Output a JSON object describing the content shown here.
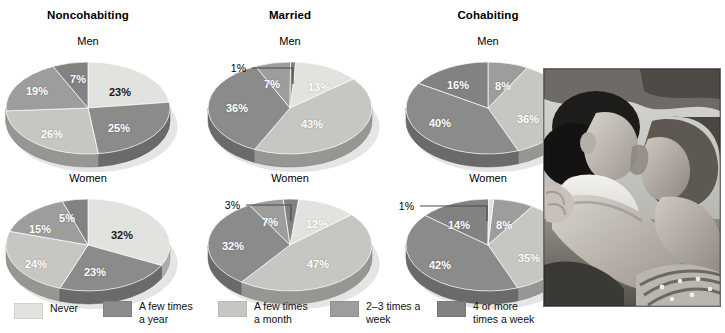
{
  "figure": {
    "columns": [
      "Noncohabiting",
      "Married",
      "Cohabiting"
    ],
    "row_labels": [
      "Men",
      "Women"
    ]
  },
  "legend": {
    "items": [
      {
        "label": "Never",
        "color": "#e2e2de"
      },
      {
        "label": "A few times\na year",
        "color": "#8b8b8b"
      },
      {
        "label": "A few times\na month",
        "color": "#c6c6c2"
      },
      {
        "label": "2–3 times  a\nweek",
        "color": "#9d9d9b"
      },
      {
        "label": "4 or more\ntimes a week",
        "color": "#828282"
      }
    ]
  },
  "photo": {
    "caption": "black-and-white photograph of a couple embracing"
  },
  "chart_data": [
    {
      "type": "pie",
      "title": "Noncohabiting — Men",
      "group": "Noncohabiting",
      "sex": "Men",
      "categories": [
        "Never",
        "A few times a year",
        "A few times a month",
        "2–3 times a week",
        "4 or more times a week"
      ],
      "labels": [
        "23%",
        "25%",
        "26%",
        "19%",
        "7%"
      ],
      "values": [
        23,
        25,
        26,
        19,
        7
      ],
      "colors": [
        "#e2e2de",
        "#8b8b8b",
        "#c6c6c2",
        "#9d9d9b",
        "#828282"
      ],
      "callout": null
    },
    {
      "type": "pie",
      "title": "Married — Men",
      "group": "Married",
      "sex": "Men",
      "categories": [
        "Never",
        "A few times a year",
        "A few times a month",
        "2–3 times a week",
        "4 or more times a week"
      ],
      "labels": [
        "13%",
        "43%",
        "36%",
        "7%",
        "1%"
      ],
      "values": [
        13,
        43,
        36,
        7,
        1
      ],
      "colors": [
        "#e2e2de",
        "#c6c6c2",
        "#8b8b8b",
        "#9d9d9b",
        "#828282"
      ],
      "callout": "1%"
    },
    {
      "type": "pie",
      "title": "Cohabiting — Men",
      "group": "Cohabiting",
      "sex": "Men",
      "categories": [
        "Never",
        "A few times a year",
        "A few times a month",
        "2–3 times a week",
        "4 or more times a week"
      ],
      "labels": [
        "8%",
        "36%",
        "40%",
        "16%"
      ],
      "values": [
        8,
        36,
        40,
        16
      ],
      "colors": [
        "#9d9d9b",
        "#c6c6c2",
        "#8b8b8b",
        "#828282"
      ],
      "callout": null
    },
    {
      "type": "pie",
      "title": "Noncohabiting — Women",
      "group": "Noncohabiting",
      "sex": "Women",
      "categories": [
        "Never",
        "A few times a year",
        "A few times a month",
        "2–3 times a week",
        "4 or more times a week"
      ],
      "labels": [
        "32%",
        "23%",
        "24%",
        "15%",
        "5%"
      ],
      "values": [
        32,
        23,
        24,
        15,
        5
      ],
      "colors": [
        "#e2e2de",
        "#8b8b8b",
        "#c6c6c2",
        "#9d9d9b",
        "#828282"
      ],
      "callout": null
    },
    {
      "type": "pie",
      "title": "Married — Women",
      "group": "Married",
      "sex": "Women",
      "categories": [
        "Never",
        "A few times a year",
        "A few times a month",
        "2–3 times a week",
        "4 or more times a week"
      ],
      "labels": [
        "12%",
        "47%",
        "32%",
        "7%",
        "3%"
      ],
      "values": [
        12,
        47,
        32,
        7,
        3
      ],
      "colors": [
        "#e2e2de",
        "#c6c6c2",
        "#8b8b8b",
        "#9d9d9b",
        "#828282"
      ],
      "callout": "3%"
    },
    {
      "type": "pie",
      "title": "Cohabiting — Women",
      "group": "Cohabiting",
      "sex": "Women",
      "categories": [
        "Never",
        "A few times a year",
        "A few times a month",
        "2–3 times a week",
        "4 or more times a week"
      ],
      "labels": [
        "8%",
        "35%",
        "42%",
        "14%",
        "1%"
      ],
      "values": [
        8,
        35,
        42,
        14,
        1
      ],
      "colors": [
        "#9d9d9b",
        "#c6c6c2",
        "#8b8b8b",
        "#828282",
        "#e2e2de"
      ],
      "callout": "1%"
    }
  ],
  "chart_layout": [
    {
      "cx": 100,
      "cy": 56,
      "rx": 82,
      "ry": 46,
      "depth": 13,
      "start": -90,
      "label_pos": [
        {
          "t": "23%",
          "x": 132,
          "y": 40,
          "tone": "dark"
        },
        {
          "t": "25%",
          "x": 131,
          "y": 76,
          "tone": "light"
        },
        {
          "t": "26%",
          "x": 64,
          "y": 82,
          "tone": "light"
        },
        {
          "t": "19%",
          "x": 49,
          "y": 39,
          "tone": "light"
        },
        {
          "t": "7%",
          "x": 90,
          "y": 27,
          "tone": "light"
        }
      ]
    },
    {
      "cx": 100,
      "cy": 56,
      "rx": 82,
      "ry": 46,
      "depth": 13,
      "start": -86,
      "label_pos": [
        {
          "t": "13%",
          "x": 129,
          "y": 35,
          "tone": "light"
        },
        {
          "t": "43%",
          "x": 122,
          "y": 72,
          "tone": "light"
        },
        {
          "t": "36%",
          "x": 47,
          "y": 56,
          "tone": "light"
        },
        {
          "t": "7%",
          "x": 82,
          "y": 32,
          "tone": "light"
        }
      ],
      "callout_pos": {
        "x": 56,
        "y": 16,
        "lx": 62,
        "ly": 16,
        "ex": 103,
        "ey": 16,
        "dy": 32
      }
    },
    {
      "cx": 100,
      "cy": 56,
      "rx": 82,
      "ry": 46,
      "depth": 13,
      "start": -90,
      "label_pos": [
        {
          "t": "8%",
          "x": 115,
          "y": 34,
          "tone": "light"
        },
        {
          "t": "36%",
          "x": 140,
          "y": 67,
          "tone": "light"
        },
        {
          "t": "40%",
          "x": 52,
          "y": 71,
          "tone": "light"
        },
        {
          "t": "16%",
          "x": 70,
          "y": 33,
          "tone": "light"
        }
      ]
    },
    {
      "cx": 100,
      "cy": 56,
      "rx": 82,
      "ry": 46,
      "depth": 13,
      "start": -90,
      "label_pos": [
        {
          "t": "32%",
          "x": 134,
          "y": 46,
          "tone": "dark"
        },
        {
          "t": "23%",
          "x": 107,
          "y": 83,
          "tone": "light"
        },
        {
          "t": "24%",
          "x": 48,
          "y": 75,
          "tone": "light"
        },
        {
          "t": "15%",
          "x": 52,
          "y": 40,
          "tone": "light"
        },
        {
          "t": "5%",
          "x": 79,
          "y": 29,
          "tone": "light"
        }
      ]
    },
    {
      "cx": 100,
      "cy": 56,
      "rx": 82,
      "ry": 46,
      "depth": 13,
      "start": -84,
      "label_pos": [
        {
          "t": "12%",
          "x": 127,
          "y": 35,
          "tone": "light"
        },
        {
          "t": "47%",
          "x": 128,
          "y": 75,
          "tone": "light"
        },
        {
          "t": "32%",
          "x": 43,
          "y": 57,
          "tone": "light"
        },
        {
          "t": "7%",
          "x": 80,
          "y": 33,
          "tone": "light"
        }
      ],
      "callout_pos": {
        "x": 50,
        "y": 16,
        "lx": 56,
        "ly": 16,
        "ex": 101,
        "ey": 16,
        "dy": 32
      }
    },
    {
      "cx": 100,
      "cy": 56,
      "rx": 82,
      "ry": 46,
      "depth": 13,
      "start": -86,
      "label_pos": [
        {
          "t": "8%",
          "x": 116,
          "y": 36,
          "tone": "light"
        },
        {
          "t": "35%",
          "x": 141,
          "y": 69,
          "tone": "light"
        },
        {
          "t": "42%",
          "x": 52,
          "y": 76,
          "tone": "light"
        },
        {
          "t": "14%",
          "x": 71,
          "y": 36,
          "tone": "light"
        }
      ],
      "callout_pos": {
        "x": 26,
        "y": 17,
        "lx": 32,
        "ly": 17,
        "ex": 99,
        "ey": 17,
        "dy": 32
      }
    }
  ]
}
